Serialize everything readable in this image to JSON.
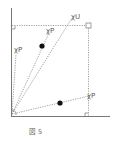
{
  "figure": {
    "caption": "図 5",
    "caption_prefix": "図",
    "caption_number": "5"
  },
  "labels": {
    "u": "χU",
    "p_upper": "χP",
    "p_left": "χP",
    "p_right": "χP"
  },
  "colors": {
    "axis": "#777777",
    "dotted": "#888888",
    "point": "#111111",
    "text": "#555555"
  }
}
